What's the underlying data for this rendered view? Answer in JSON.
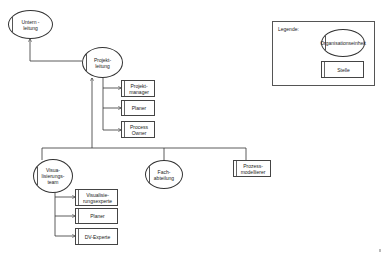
{
  "diagram": {
    "type": "org-chart",
    "nodes": {
      "unternehmensleitung": {
        "label": "Untern -\nleitung",
        "shape": "ellipse"
      },
      "projektleitung": {
        "label": "Projekt-\nleitung",
        "shape": "ellipse"
      },
      "projektmanager": {
        "label": "Projekt-\nmanager",
        "shape": "box"
      },
      "planer_pl": {
        "label": "Planer",
        "shape": "box"
      },
      "process_owner": {
        "label": "Process\nOwner",
        "shape": "box"
      },
      "visualisierungsteam": {
        "label": "Visua-\nlisierungs-\nteam",
        "shape": "ellipse"
      },
      "fachabteilung": {
        "label": "Fach-\nabteilung",
        "shape": "ellipse"
      },
      "prozessmodellierer": {
        "label": "Prozess-\nmodellierer",
        "shape": "box"
      },
      "visualisierungsexperte": {
        "label": "Visualisie-\nrungsexperte",
        "shape": "box"
      },
      "planer_vt": {
        "label": "Planer",
        "shape": "box"
      },
      "dv_experte": {
        "label": "DV-Experte",
        "shape": "box"
      }
    },
    "edges": [
      [
        "projektleitung",
        "unternehmensleitung"
      ],
      [
        "projektleitung",
        "projektmanager"
      ],
      [
        "projektleitung",
        "planer_pl"
      ],
      [
        "projektleitung",
        "process_owner"
      ],
      [
        "visualisierungsteam",
        "projektleitung"
      ],
      [
        "projektleitung",
        "fachabteilung"
      ],
      [
        "projektleitung",
        "prozessmodellierer"
      ],
      [
        "visualisierungsteam",
        "visualisierungsexperte"
      ],
      [
        "visualisierungsteam",
        "planer_vt"
      ],
      [
        "visualisierungsteam",
        "dv_experte"
      ]
    ]
  },
  "legend": {
    "title": "Legende:",
    "org_unit_label": "Organisationseinheit",
    "position_label": "Stelle"
  },
  "colors": {
    "line": "#333333",
    "background": "#ffffff"
  }
}
